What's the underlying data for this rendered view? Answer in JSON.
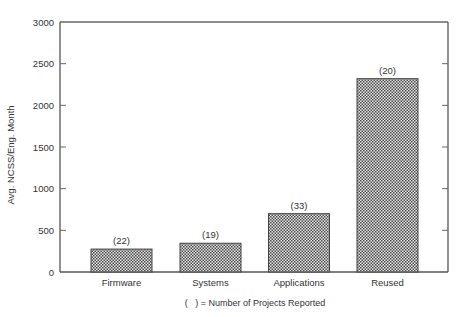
{
  "chart_data": {
    "type": "bar",
    "title": "",
    "xlabel": "",
    "ylabel": "Avg. NCSS/Eng. Month",
    "ylim": [
      0,
      3000
    ],
    "yticks": [
      0,
      500,
      1000,
      1500,
      2000,
      2500,
      3000
    ],
    "ytick_labels": [
      "0",
      "500",
      "1000",
      "1500",
      "2000",
      "2500",
      "3000"
    ],
    "categories": [
      "Firmware",
      "Systems",
      "Applications",
      "Reused"
    ],
    "values": [
      275,
      345,
      700,
      2320
    ],
    "bar_annotations": [
      "(22)",
      "(19)",
      "(33)",
      "(20)"
    ],
    "footnote": "(   ) = Number of Projects Reported",
    "grid": false,
    "legend": null,
    "bar_fill": "crosshatch",
    "colors": {
      "axis": "#555555",
      "bar_fill_dark": "#555555",
      "bar_fill_light": "#e6e6e6",
      "text": "#333333"
    }
  }
}
